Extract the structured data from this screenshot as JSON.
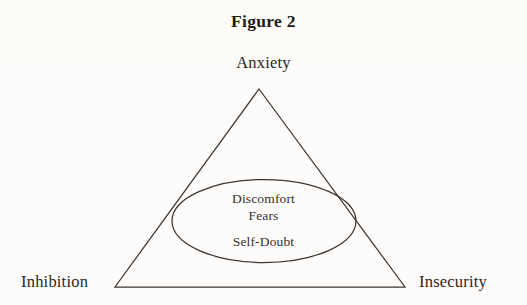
{
  "figure": {
    "title": "Figure 2",
    "apex_label": "Anxiety",
    "left_corner_label": "Inhibition",
    "right_corner_label": "Insecurity",
    "core_items": [
      "Discomfort",
      "Fears",
      "Self-Doubt"
    ],
    "shapes": {
      "triangle": {
        "apex": [
          259,
          89
        ],
        "bottom_left": [
          115,
          287
        ],
        "bottom_right": [
          405,
          287
        ]
      },
      "ellipse": {
        "center": [
          264,
          221
        ],
        "radius_x": 92,
        "radius_y": 41.5
      }
    },
    "colors": {
      "page_background": "#fdfcfa",
      "ink": "#2a2625",
      "stroke": "#3a3634"
    }
  }
}
